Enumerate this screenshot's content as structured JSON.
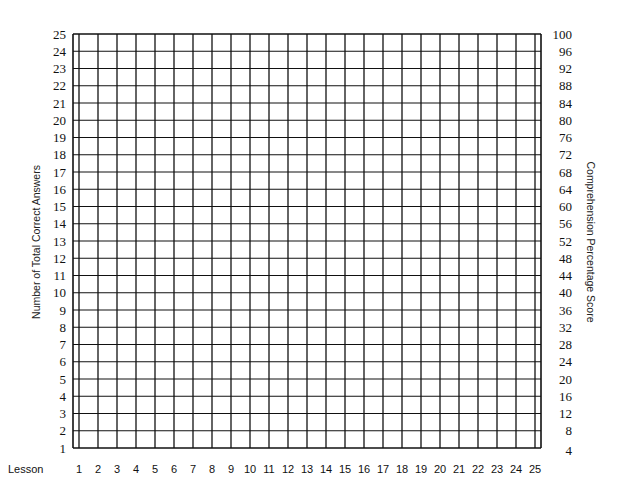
{
  "chart_data": {
    "type": "table",
    "title": "",
    "xlabel": "Lesson",
    "ylabel": "Number of Total Correct Answers",
    "ylabel_right": "Comprehension Percentage Score",
    "x_ticks": [
      "1",
      "2",
      "3",
      "4",
      "5",
      "6",
      "7",
      "8",
      "9",
      "10",
      "11",
      "12",
      "13",
      "14",
      "15",
      "16",
      "17",
      "18",
      "19",
      "20",
      "21",
      "22",
      "23",
      "24",
      "25"
    ],
    "y_ticks_left": [
      "25",
      "24",
      "23",
      "22",
      "21",
      "20",
      "19",
      "18",
      "17",
      "16",
      "15",
      "14",
      "13",
      "12",
      "11",
      "10",
      "9",
      "8",
      "7",
      "6",
      "5",
      "4",
      "3",
      "2",
      "1"
    ],
    "y_ticks_right": [
      "100",
      "96",
      "92",
      "88",
      "84",
      "80",
      "76",
      "72",
      "68",
      "64",
      "60",
      "56",
      "52",
      "48",
      "44",
      "40",
      "36",
      "32",
      "28",
      "24",
      "20",
      "16",
      "12",
      "8",
      "4"
    ],
    "ylim": [
      1,
      25
    ],
    "ylim_right": [
      4,
      100
    ],
    "grid": true,
    "series": [],
    "colors": {
      "grid": "#111111",
      "text": "#111111",
      "background": "#ffffff"
    }
  },
  "labels": {
    "lesson": "Lesson",
    "left_axis_title": "Number of Total Correct Answers",
    "right_axis_title": "Comprehension Percentage Score"
  }
}
